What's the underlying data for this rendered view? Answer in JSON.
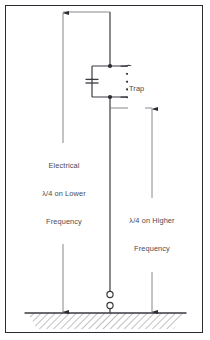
{
  "figure": {
    "background_color": "#ffffff",
    "border_color": "#2b2b33",
    "line_color": "#4a4a52",
    "text_color": "#4a4a52"
  },
  "labels": {
    "trap": "Trap",
    "lower_line1": "Electrical",
    "lower_line2": "λ/4 on Lower",
    "lower_line3": "Frequency",
    "higher_line1": "λ/4 on Higher",
    "higher_line2": "Frequency"
  },
  "components": {
    "antenna_element": "vertical-radiator",
    "trap_circuit": "parallel-lc-trap",
    "capacitor": "capacitor-symbol",
    "inductor": "inductor-coil-symbol",
    "ground": "ground-plane-hatched",
    "feedpoint": "feedpoint-terminals"
  },
  "dimensions": {
    "left": {
      "name": "electrical-quarter-wave-lower",
      "top_arrow": "up",
      "bottom_arrow": "down"
    },
    "right": {
      "name": "quarter-wave-higher",
      "top_arrow": "down",
      "bottom_arrow": "down"
    }
  }
}
